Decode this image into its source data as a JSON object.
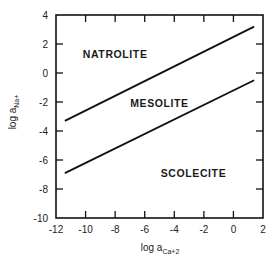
{
  "chart_data": {
    "type": "line",
    "title": "",
    "xlabel": "log a_Ca+2",
    "ylabel": "log a_Na+",
    "xlabel_main": "log a",
    "xlabel_sub": "Ca+2",
    "ylabel_main": "log a",
    "ylabel_sub": "Na+",
    "xlim": [
      -12,
      2
    ],
    "ylim": [
      -10,
      4
    ],
    "x_ticks": [
      -12,
      -10,
      -8,
      -6,
      -4,
      -2,
      0,
      2
    ],
    "x_tick_labels": [
      "-12",
      "-10",
      "-8",
      "-6",
      "-4",
      "-2",
      "0",
      "2"
    ],
    "y_ticks": [
      4,
      2,
      0,
      -2,
      -4,
      -6,
      -8,
      -10
    ],
    "y_tick_labels": [
      "4",
      "2",
      "0",
      "-2",
      "-4",
      "-6",
      "-8",
      "-10"
    ],
    "grid": false,
    "legend": null,
    "series": [
      {
        "name": "Natrolite/Mesolite boundary",
        "x": [
          -11.4,
          1.4
        ],
        "y": [
          -3.3,
          3.2
        ]
      },
      {
        "name": "Mesolite/Scolecite boundary",
        "x": [
          -11.4,
          1.4
        ],
        "y": [
          -6.9,
          -0.5
        ]
      }
    ],
    "annotations": [
      {
        "text": "NATROLITE",
        "x": -8.0,
        "y": 1.3
      },
      {
        "text": "MESOLITE",
        "x": -5.0,
        "y": -2.1
      },
      {
        "text": "SCOLECITE",
        "x": -2.7,
        "y": -6.9
      }
    ]
  }
}
